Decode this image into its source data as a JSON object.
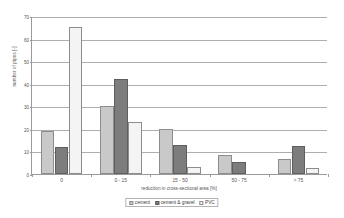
{
  "chart_data": {
    "type": "bar",
    "title": "",
    "xlabel": "reduction in cross-sectional area [%]",
    "ylabel": "number of pipes [-]",
    "categories": [
      "0",
      "0 - 15",
      "15 - 50",
      "50 - 75",
      "> 75"
    ],
    "series": [
      {
        "name": "cement",
        "color": "#c9c9c9",
        "values": [
          19,
          30,
          20,
          8.5,
          6.5
        ]
      },
      {
        "name": "cement & gravel",
        "color": "#7d7d7d",
        "values": [
          12,
          42,
          13,
          5.5,
          12.5
        ]
      },
      {
        "name": "PVC",
        "color": "#f4f4f4",
        "values": [
          65,
          23,
          3,
          0,
          2.5
        ]
      }
    ],
    "ylim": [
      0,
      70
    ],
    "ytick_labels": [
      "0",
      "10",
      "20",
      "30",
      "40",
      "50",
      "60",
      "70"
    ],
    "ytick_values": [
      0,
      10,
      20,
      30,
      40,
      50,
      60,
      70
    ],
    "grid": "horizontal",
    "legend_position": "bottom-center",
    "legend_entries": [
      "cement",
      "cement & gravel",
      "PVC"
    ]
  }
}
